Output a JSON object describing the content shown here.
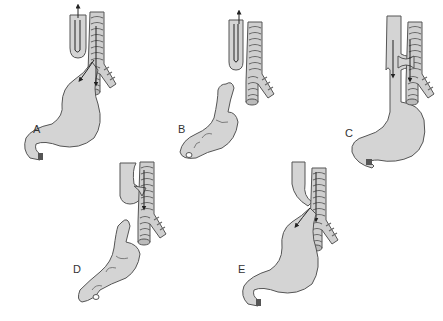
{
  "figure": {
    "type": "anatomical-diagram",
    "panels": [
      {
        "id": "A",
        "label": "A",
        "description": "Proximal esophageal pouch with distal tracheoesophageal fistula to stomach"
      },
      {
        "id": "B",
        "label": "B",
        "description": "Isolated esophageal atresia without fistula; small stomach"
      },
      {
        "id": "C",
        "label": "C",
        "description": "H-type tracheoesophageal fistula with continuous esophagus"
      },
      {
        "id": "D",
        "label": "D",
        "description": "Proximal fistula from upper pouch to trachea; small stomach"
      },
      {
        "id": "E",
        "label": "E",
        "description": "Proximal and distal fistulas to trachea"
      }
    ]
  },
  "colors": {
    "background": "#ffffff",
    "organ_fill": "#d4d4d4",
    "outline": "#555555",
    "arrow": "#222222",
    "label": "#333333"
  }
}
